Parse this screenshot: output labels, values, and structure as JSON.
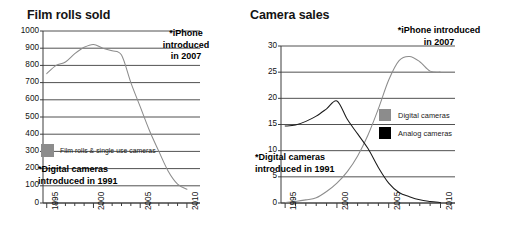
{
  "charts": {
    "left": {
      "title": "Film rolls sold",
      "annotation_iphone": [
        "*iPhone",
        "introduced",
        "in 2007"
      ],
      "annotation_digital": [
        "*Digital cameras",
        "introduced in 1991"
      ],
      "legend": [
        {
          "label": "Film rolls & single use cameras",
          "color": "#8c8c8c"
        }
      ]
    },
    "right": {
      "title": "Camera sales",
      "annotation_iphone": [
        "*iPhone introduced",
        "in 2007"
      ],
      "annotation_digital": [
        "*Digital cameras",
        "introduced in 1991"
      ],
      "legend": [
        {
          "label": "Digital cameras",
          "color": "#8c8c8c"
        },
        {
          "label": "Analog cameras",
          "color": "#000000"
        }
      ]
    }
  },
  "chart_data": [
    {
      "id": "film-rolls-sold",
      "type": "line",
      "title": "Film rolls sold",
      "xlabel": "",
      "ylabel": "",
      "xlim": [
        1994.6,
        2011.4
      ],
      "ylim": [
        0,
        1000
      ],
      "yticks": [
        0,
        100,
        200,
        300,
        400,
        500,
        600,
        700,
        800,
        900,
        1000
      ],
      "xticks_major": [
        1995,
        2000,
        2005,
        2010
      ],
      "xticks_minor_step": 1,
      "grid": true,
      "legend_position": "inside-left",
      "series": [
        {
          "name": "Film rolls & single use cameras",
          "color": "#8c8c8c",
          "x": [
            1995,
            1996,
            1997,
            1998,
            1999,
            2000,
            2001,
            2002,
            2003,
            2004,
            2005,
            2006,
            2007,
            2008,
            2009,
            2010
          ],
          "values": [
            752,
            800,
            820,
            868,
            905,
            922,
            900,
            885,
            860,
            700,
            560,
            420,
            300,
            185,
            110,
            80
          ]
        }
      ],
      "annotations": [
        {
          "text": "*iPhone introduced in 2007",
          "bold": true
        },
        {
          "text": "*Digital cameras introduced in 1991",
          "bold": true
        }
      ]
    },
    {
      "id": "camera-sales",
      "type": "line",
      "title": "Camera sales",
      "xlabel": "",
      "ylabel": "",
      "xlim": [
        1994.6,
        2011.4
      ],
      "ylim": [
        0,
        30
      ],
      "yticks": [
        0,
        5,
        10,
        15,
        20,
        25,
        30
      ],
      "xticks_major": [
        1995,
        2000,
        2005,
        2010
      ],
      "xticks_minor_step": 1,
      "grid": true,
      "legend_position": "inside-right",
      "series": [
        {
          "name": "Digital cameras",
          "color": "#8c8c8c",
          "x": [
            1995,
            1996,
            1997,
            1998,
            1999,
            2000,
            2001,
            2002,
            2003,
            2004,
            2005,
            2006,
            2007,
            2008,
            2009,
            2010
          ],
          "values": [
            0.1,
            0.3,
            0.6,
            1.0,
            2.2,
            3.8,
            6.0,
            9.0,
            13.0,
            18.0,
            23.5,
            27.2,
            28.0,
            27.0,
            25.2,
            25.0
          ]
        },
        {
          "name": "Analog cameras",
          "color": "#1a1a1a",
          "x": [
            1995,
            1996,
            1997,
            1998,
            1999,
            2000,
            2001,
            2002,
            2003,
            2004,
            2005,
            2006,
            2007,
            2008,
            2009,
            2010
          ],
          "values": [
            14.7,
            14.9,
            15.6,
            16.6,
            18.0,
            19.5,
            16.0,
            13.2,
            10.4,
            6.8,
            3.8,
            2.0,
            1.2,
            0.6,
            0.3,
            0.1
          ]
        }
      ],
      "annotations": [
        {
          "text": "*iPhone introduced in 2007",
          "bold": true
        },
        {
          "text": "*Digital cameras introduced in 1991",
          "bold": true
        }
      ]
    }
  ]
}
